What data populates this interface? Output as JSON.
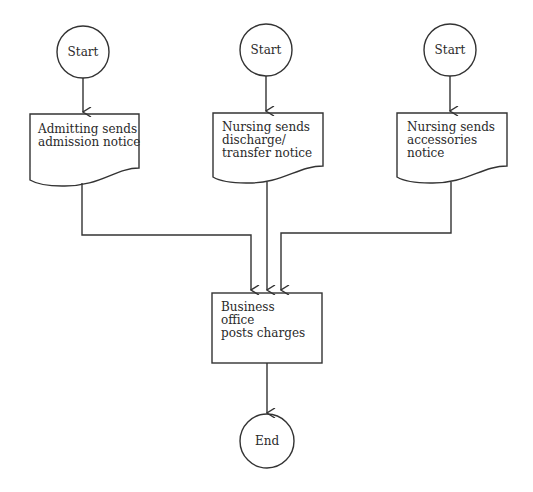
{
  "diagram": {
    "type": "flowchart",
    "nodes": {
      "start1": {
        "shape": "circle",
        "label": "Start"
      },
      "start2": {
        "shape": "circle",
        "label": "Start"
      },
      "start3": {
        "shape": "circle",
        "label": "Start"
      },
      "doc1": {
        "shape": "document",
        "label_lines": [
          "Admitting sends",
          "admission notice"
        ]
      },
      "doc2": {
        "shape": "document",
        "label_lines": [
          "Nursing sends",
          "discharge/",
          "transfer notice"
        ]
      },
      "doc3": {
        "shape": "document",
        "label_lines": [
          "Nursing sends",
          "accessories",
          "notice"
        ]
      },
      "process": {
        "shape": "rectangle",
        "label_lines": [
          "Business",
          "office",
          "posts charges"
        ]
      },
      "end": {
        "shape": "circle",
        "label": "End"
      }
    },
    "edges": [
      {
        "from": "start1",
        "to": "doc1"
      },
      {
        "from": "start2",
        "to": "doc2"
      },
      {
        "from": "start3",
        "to": "doc3"
      },
      {
        "from": "doc1",
        "to": "process"
      },
      {
        "from": "doc2",
        "to": "process"
      },
      {
        "from": "doc3",
        "to": "process"
      },
      {
        "from": "process",
        "to": "end"
      }
    ],
    "line_color": "#333333"
  }
}
